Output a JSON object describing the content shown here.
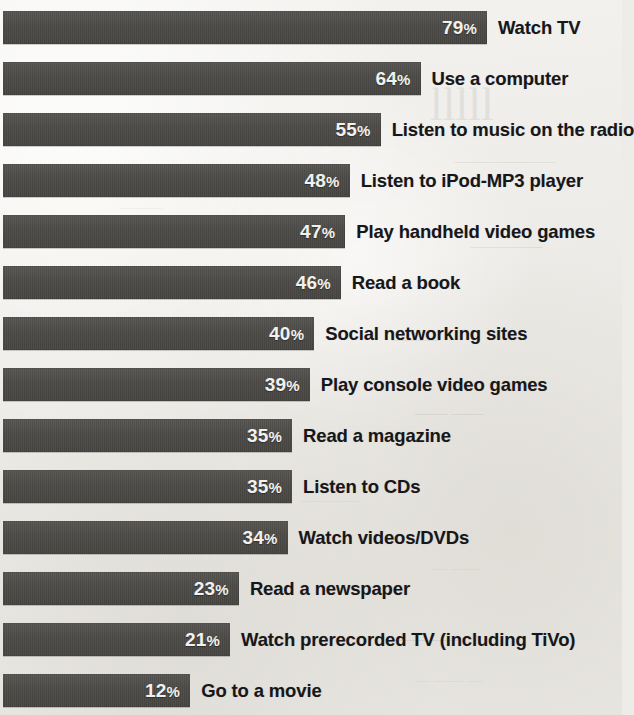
{
  "chart_data": {
    "type": "bar",
    "orientation": "horizontal",
    "title": "",
    "subtitle": "",
    "xlabel": "",
    "ylabel": "",
    "xlim": [
      0,
      100
    ],
    "grid": false,
    "legend": false,
    "value_suffix": "%",
    "categories": [
      "Watch TV",
      "Use a computer",
      "Listen to music on the radio",
      "Listen to iPod-MP3 player",
      "Play handheld video games",
      "Read a book",
      "Social networking sites",
      "Play console video games",
      "Read a magazine",
      "Listen to CDs",
      "Watch videos/DVDs",
      "Read a newspaper",
      "Watch prerecorded TV (including TiVo)",
      "Go to a movie"
    ],
    "values": [
      79,
      64,
      55,
      48,
      47,
      46,
      40,
      39,
      35,
      35,
      34,
      23,
      21,
      12
    ],
    "value_labels": [
      "79%",
      "64%",
      "55%",
      "48%",
      "47%",
      "46%",
      "40%",
      "39%",
      "35%",
      "35%",
      "34%",
      "23%",
      "21%",
      "12%"
    ],
    "bars": [
      {
        "label": "Watch TV",
        "value": 79,
        "value_label": "79%"
      },
      {
        "label": "Use a computer",
        "value": 64,
        "value_label": "64%"
      },
      {
        "label": "Listen to music on the radio",
        "value": 55,
        "value_label": "55%"
      },
      {
        "label": "Listen to iPod-MP3 player",
        "value": 48,
        "value_label": "48%"
      },
      {
        "label": "Play handheld video games",
        "value": 47,
        "value_label": "47%"
      },
      {
        "label": "Read a book",
        "value": 46,
        "value_label": "46%"
      },
      {
        "label": "Social networking sites",
        "value": 40,
        "value_label": "40%"
      },
      {
        "label": "Play console video games",
        "value": 39,
        "value_label": "39%"
      },
      {
        "label": "Read a magazine",
        "value": 35,
        "value_label": "35%"
      },
      {
        "label": "Listen to CDs",
        "value": 35,
        "value_label": "35%"
      },
      {
        "label": "Watch videos/DVDs",
        "value": 34,
        "value_label": "34%"
      },
      {
        "label": "Read a newspaper",
        "value": 23,
        "value_label": "23%"
      },
      {
        "label": "Watch prerecorded TV (including TiVo)",
        "value": 21,
        "value_label": "21%"
      },
      {
        "label": "Go to a movie",
        "value": 12,
        "value_label": "12%"
      }
    ],
    "colors": {
      "bar_fill": "#4b4a47",
      "value_text": "#f2f1ee",
      "label_text": "#17171a",
      "background": "#edece9"
    }
  },
  "layout": {
    "bar_left_px": 3,
    "bar_height_px": 33,
    "row_pitch_px": 51,
    "first_row_top_px": 11,
    "scale_intercept_px": 137,
    "scale_px_per_percent": 4.43,
    "value_label_inset_px": 10,
    "label_gap_px": 11
  }
}
